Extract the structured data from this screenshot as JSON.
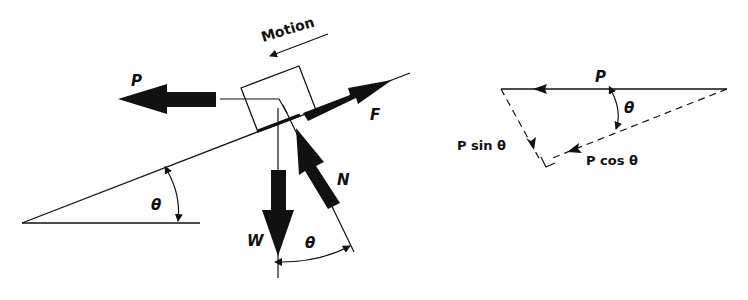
{
  "figure": {
    "left_diagram": {
      "title": "Block on inclined plane free-body diagram",
      "motion_label": "Motion",
      "forces": [
        {
          "symbol": "P",
          "direction": "horizontal, left"
        },
        {
          "symbol": "F",
          "direction": "up the incline"
        },
        {
          "symbol": "W",
          "direction": "vertical, down"
        },
        {
          "symbol": "N",
          "direction": "normal to incline"
        }
      ],
      "angle_labels": [
        "θ",
        "θ"
      ]
    },
    "right_diagram": {
      "title": "Resolution of P into components",
      "vector_label": "P",
      "angle_label": "θ",
      "component_sin": "P sin θ",
      "component_cos": "P cos θ"
    },
    "colors": {
      "ink": "#111111",
      "background": "#ffffff"
    }
  },
  "labels": {
    "motion": "Motion",
    "P": "P",
    "F": "F",
    "W": "W",
    "N": "N",
    "theta": "θ",
    "P2": "P",
    "theta2": "θ",
    "psin": "P sin θ",
    "pcos": "P cos θ"
  }
}
